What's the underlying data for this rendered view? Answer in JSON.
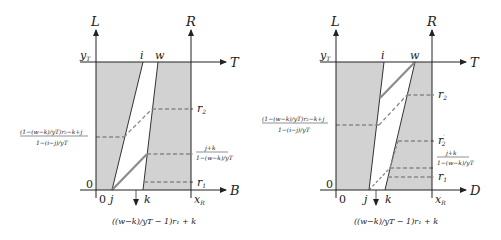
{
  "colors": {
    "shade": "#d2d2d2",
    "axis": "#222222",
    "thick_line": "#8c8c8c",
    "dash": "#888888"
  },
  "left_diagram": {
    "axes": {
      "left_vertical": "L",
      "right_vertical": "R",
      "top_horizontal": "T",
      "bottom_horizontal": "B"
    },
    "top_labels": {
      "yT": "y",
      "yT_sub": "T",
      "i": "i",
      "w": "w"
    },
    "bottom_labels": {
      "origin_y": "0",
      "origin_x": "0",
      "j": "j",
      "k": "k",
      "xR": "x",
      "xR_sub": "R"
    },
    "right_labels": {
      "r2": "r",
      "r2_sub": "2",
      "r1": "r",
      "r1_sub": "1",
      "frac_num": "j+k",
      "frac_den": "1−(w−k)/yT"
    },
    "left_label": {
      "num": "(1−(w−k)/yT)r₂−k+j",
      "den": "1−(i−j)/yT"
    },
    "bottom_formula": "((w−k)/yT − 1)r₁ + k"
  },
  "right_diagram": {
    "axes": {
      "left_vertical": "L",
      "right_vertical": "R",
      "top_horizontal": "T",
      "bottom_horizontal": "D"
    },
    "top_labels": {
      "yT": "y",
      "yT_sub": "T",
      "i": "i",
      "w": "w"
    },
    "bottom_labels": {
      "origin_y": "0",
      "origin_x": "0",
      "j": "j",
      "k": "k",
      "xR": "x",
      "xR_sub": "R"
    },
    "right_labels": {
      "r2": "r",
      "r2_sub": "2",
      "r2p": "r",
      "r2p_sub": "2",
      "r2p_prime": "′",
      "r1": "r",
      "r1_sub": "1",
      "frac_num": "j+k",
      "frac_den": "1−(w−k)/yT"
    },
    "left_label": {
      "num": "(1−(w−k)/yT)r₂−k+j",
      "den": "1−(i−j)/yT"
    },
    "bottom_formula": "((w−k)/yT − 1)r₁ + k"
  }
}
